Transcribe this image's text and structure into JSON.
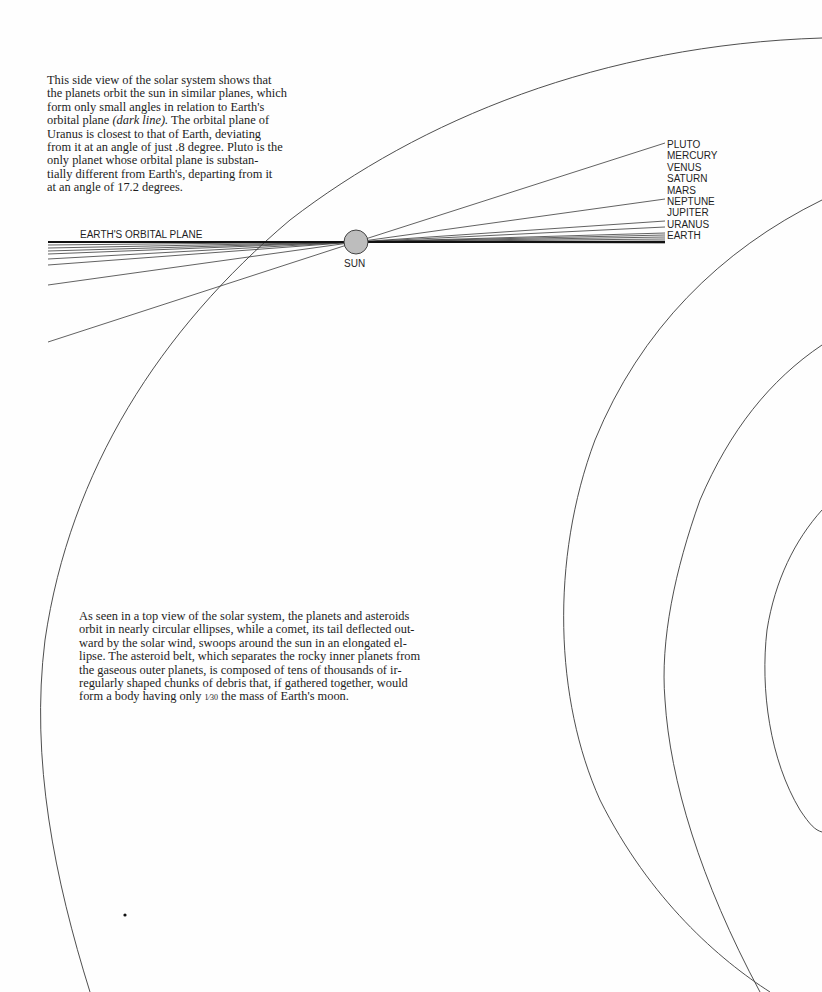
{
  "side_view_caption": {
    "lines": [
      "This side view of the solar system shows that",
      "the planets orbit the sun in similar planes, which",
      "form only small angles in relation to Earth's",
      "orbital plane ",
      "Uranus is closest to that of Earth, deviating",
      "from it at an angle of just .8 degree. Pluto is the",
      "only planet whose orbital plane is substan-",
      "tially different from Earth's, departing from it",
      "at an angle of 17.2 degrees."
    ],
    "emphasis": "(dark line).",
    "line4_tail": " The orbital plane of"
  },
  "diagram": {
    "earth_plane_label": "EARTH'S ORBITAL PLANE",
    "sun_label": "SUN",
    "sun_color": "#bdbdbd",
    "line_color": "#3a3a3a",
    "dark_line_color": "#111111",
    "sun": {
      "cx": 356,
      "cy": 242,
      "r": 12
    },
    "planet_labels": [
      "PLUTO",
      "MERCURY",
      "VENUS",
      "SATURN",
      "MARS",
      "NEPTUNE",
      "JUPITER",
      "URANUS",
      "EARTH"
    ],
    "right_line_ends": [
      {
        "planet": "PLUTO",
        "x": 665,
        "y": 143
      },
      {
        "planet": "NEPTUNE",
        "x": 665,
        "y": 199
      },
      {
        "planet": "JUPITER",
        "x": 665,
        "y": 223
      },
      {
        "planet": "URANUS",
        "x": 665,
        "y": 228
      },
      {
        "planet": "EARTH",
        "x": 665,
        "y": 242
      }
    ],
    "left_line_ends": [
      {
        "x": 48,
        "y": 248
      },
      {
        "x": 48,
        "y": 251
      },
      {
        "x": 48,
        "y": 254
      },
      {
        "x": 48,
        "y": 259
      },
      {
        "x": 48,
        "y": 265
      },
      {
        "x": 48,
        "y": 285
      },
      {
        "x": 48,
        "y": 342
      }
    ]
  },
  "top_view_caption": {
    "lines": [
      "As seen in a top view of the solar system, the planets and asteroids",
      "orbit in nearly circular ellipses, while a comet, its tail deflected out-",
      "ward by the solar wind, swoops around the sun in an elongated el-",
      "lipse. The asteroid belt, which separates the rocky inner planets from",
      "the gaseous outer planets, is composed of tens of thousands of ir-",
      "regularly shaped chunks of debris that, if gathered together, would"
    ],
    "last_line_pre": "form a body having only ",
    "fraction": "1⁄30",
    "last_line_post": " the mass of Earth's moon."
  }
}
